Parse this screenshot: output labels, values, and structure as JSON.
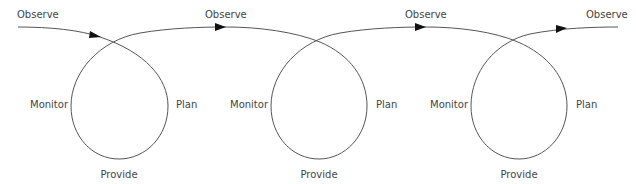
{
  "diagram": {
    "type": "cyclic-loop-sequence",
    "line_color": "#555555",
    "arrow_color": "#111111",
    "text_color": "#444444",
    "observe_labels": [
      {
        "label": "Observe"
      },
      {
        "label": "Observe"
      },
      {
        "label": "Observe"
      },
      {
        "label": "Observe"
      }
    ],
    "loops": [
      {
        "left": "Monitor",
        "right": "Plan",
        "bottom": "Provide"
      },
      {
        "left": "Monitor",
        "right": "Plan",
        "bottom": "Provide"
      },
      {
        "left": "Monitor",
        "right": "Plan",
        "bottom": "Provide"
      }
    ]
  }
}
